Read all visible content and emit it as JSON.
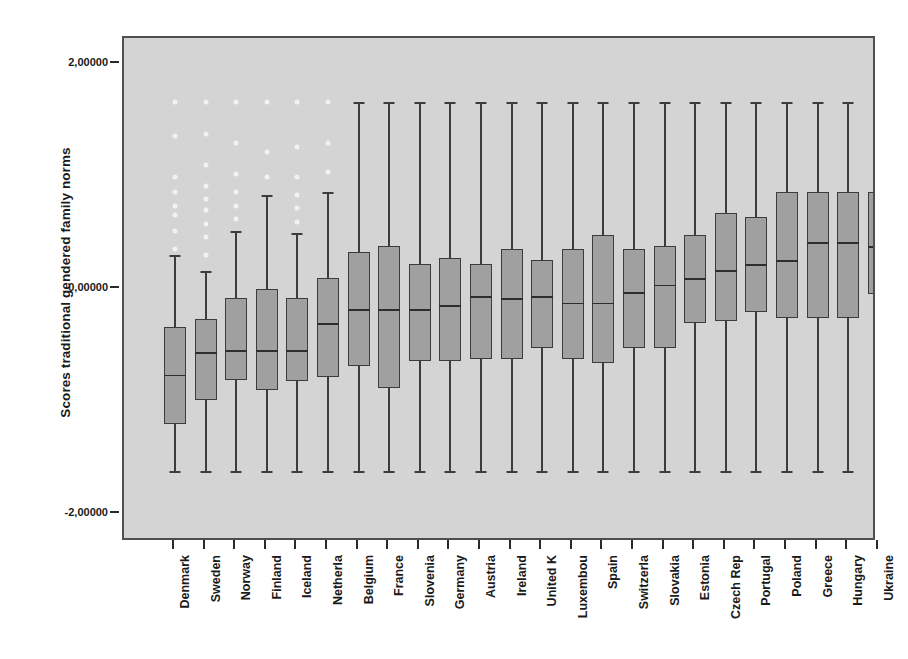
{
  "chart_data": {
    "type": "box",
    "title": "",
    "xlabel": "",
    "ylabel": "Scores traditional gendered family norms",
    "ylim": [
      -2.4,
      2.4
    ],
    "ytick_labels": [
      "2,00000",
      "0,00000",
      "-2,00000"
    ],
    "ytick_values": [
      2.0,
      0.0,
      -2.0
    ],
    "grid": false,
    "legend": "none",
    "plot_background": "#d4d4d4",
    "box_fill": "#a0a0a0",
    "box_edge": "#3c3c3c",
    "outlier_color": "#f2f2f2",
    "categories": [
      "Denmark",
      "Sweden",
      "Norway",
      "Finland",
      "Iceland",
      "Netherla",
      "Belgium",
      "France",
      "Slovenia",
      "Germany",
      "Austria",
      "Ireland",
      "United K",
      "Luxembou",
      "Spain",
      "Switzerla",
      "Slovakia",
      "Estonia",
      "Czech Rep",
      "Portugal",
      "Poland",
      "Greece",
      "Hungary",
      "Ukraine"
    ],
    "boxes": [
      {
        "label": "Denmark",
        "whisker_low": -1.62,
        "q1": -1.2,
        "median": -0.76,
        "q3": -0.34,
        "whisker_high": 0.3,
        "outliers": [
          0.36,
          0.52,
          0.66,
          0.74,
          0.86,
          1.0,
          1.36,
          1.66
        ]
      },
      {
        "label": "Sweden",
        "whisker_low": -1.62,
        "q1": -0.99,
        "median": -0.56,
        "q3": -0.27,
        "whisker_high": 0.16,
        "outliers": [
          0.3,
          0.46,
          0.58,
          0.7,
          0.8,
          0.92,
          1.1,
          1.38,
          1.66
        ]
      },
      {
        "label": "Norway",
        "whisker_low": -1.62,
        "q1": -0.81,
        "median": -0.54,
        "q3": -0.08,
        "whisker_high": 0.52,
        "outliers": [
          0.62,
          0.74,
          0.86,
          1.02,
          1.3,
          1.66
        ]
      },
      {
        "label": "Finland",
        "whisker_low": -1.62,
        "q1": -0.9,
        "median": -0.54,
        "q3": 0.0,
        "whisker_high": 0.84,
        "outliers": [
          1.0,
          1.22,
          1.66
        ]
      },
      {
        "label": "Iceland",
        "whisker_low": -1.62,
        "q1": -0.82,
        "median": -0.54,
        "q3": -0.08,
        "whisker_high": 0.5,
        "outliers": [
          0.6,
          0.72,
          0.84,
          1.0,
          1.26,
          1.66
        ]
      },
      {
        "label": "Netherla",
        "whisker_low": -1.62,
        "q1": -0.78,
        "median": -0.3,
        "q3": 0.1,
        "whisker_high": 0.86,
        "outliers": [
          1.04,
          1.3,
          1.66
        ]
      },
      {
        "label": "Belgium",
        "whisker_low": -1.62,
        "q1": -0.68,
        "median": -0.18,
        "q3": 0.33,
        "whisker_high": 1.66,
        "outliers": []
      },
      {
        "label": "France",
        "whisker_low": -1.62,
        "q1": -0.88,
        "median": -0.18,
        "q3": 0.38,
        "whisker_high": 1.66,
        "outliers": []
      },
      {
        "label": "Slovenia",
        "whisker_low": -1.62,
        "q1": -0.64,
        "median": -0.18,
        "q3": 0.22,
        "whisker_high": 1.66,
        "outliers": []
      },
      {
        "label": "Germany",
        "whisker_low": -1.62,
        "q1": -0.64,
        "median": -0.14,
        "q3": 0.28,
        "whisker_high": 1.66,
        "outliers": []
      },
      {
        "label": "Austria",
        "whisker_low": -1.62,
        "q1": -0.62,
        "median": -0.06,
        "q3": 0.22,
        "whisker_high": 1.66,
        "outliers": []
      },
      {
        "label": "Ireland",
        "whisker_low": -1.62,
        "q1": -0.62,
        "median": -0.08,
        "q3": 0.36,
        "whisker_high": 1.66,
        "outliers": []
      },
      {
        "label": "United K",
        "whisker_low": -1.62,
        "q1": -0.52,
        "median": -0.06,
        "q3": 0.26,
        "whisker_high": 1.66,
        "outliers": []
      },
      {
        "label": "Luxembou",
        "whisker_low": -1.62,
        "q1": -0.62,
        "median": -0.12,
        "q3": 0.36,
        "whisker_high": 1.66,
        "outliers": []
      },
      {
        "label": "Spain",
        "whisker_low": -1.62,
        "q1": -0.66,
        "median": -0.12,
        "q3": 0.48,
        "whisker_high": 1.66,
        "outliers": []
      },
      {
        "label": "Switzerla",
        "whisker_low": -1.62,
        "q1": -0.52,
        "median": -0.03,
        "q3": 0.36,
        "whisker_high": 1.66,
        "outliers": []
      },
      {
        "label": "Slovakia",
        "whisker_low": -1.62,
        "q1": -0.52,
        "median": 0.04,
        "q3": 0.38,
        "whisker_high": 1.66,
        "outliers": []
      },
      {
        "label": "Estonia",
        "whisker_low": -1.62,
        "q1": -0.3,
        "median": 0.1,
        "q3": 0.48,
        "whisker_high": 1.66,
        "outliers": []
      },
      {
        "label": "Czech Rep",
        "whisker_low": -1.62,
        "q1": -0.28,
        "median": 0.17,
        "q3": 0.68,
        "whisker_high": 1.66,
        "outliers": []
      },
      {
        "label": "Portugal",
        "whisker_low": -1.62,
        "q1": -0.2,
        "median": 0.22,
        "q3": 0.64,
        "whisker_high": 1.66,
        "outliers": []
      },
      {
        "label": "Poland",
        "whisker_low": -1.62,
        "q1": -0.26,
        "median": 0.26,
        "q3": 0.86,
        "whisker_high": 1.66,
        "outliers": []
      },
      {
        "label": "Greece",
        "whisker_low": -1.62,
        "q1": -0.26,
        "median": 0.42,
        "q3": 0.86,
        "whisker_high": 1.66,
        "outliers": []
      },
      {
        "label": "Hungary",
        "whisker_low": -1.62,
        "q1": -0.26,
        "median": 0.42,
        "q3": 0.86,
        "whisker_high": 1.66,
        "outliers": []
      },
      {
        "label": "Ukraine",
        "whisker_low": -1.62,
        "q1": -0.04,
        "median": 0.38,
        "q3": 0.86,
        "whisker_high": 1.66,
        "outliers": []
      }
    ]
  }
}
